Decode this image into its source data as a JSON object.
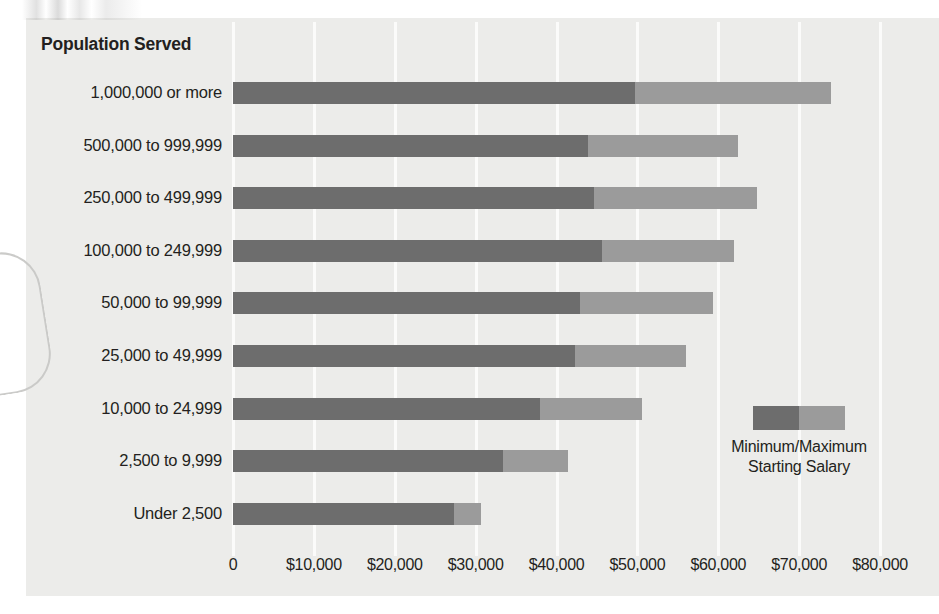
{
  "chart_data": {
    "type": "bar",
    "orientation": "horizontal",
    "stacked": false,
    "title": "Population Served",
    "xlabel": "",
    "ylabel": "Population Served",
    "xlim": [
      0,
      80000
    ],
    "xtick_values": [
      0,
      10000,
      20000,
      30000,
      40000,
      50000,
      60000,
      70000,
      80000
    ],
    "xtick_labels": [
      "0",
      "$10,000",
      "$20,000",
      "$30,000",
      "$40,000",
      "$50,000",
      "$60,000",
      "$70,000",
      "$80,000"
    ],
    "grid": true,
    "grid_axis": "x",
    "legend_position": "inside-right",
    "legend_label": "Minimum/Maximum Starting Salary",
    "legend_label_line1": "Minimum/Maximum",
    "legend_label_line2": "Starting Salary",
    "categories": [
      "1,000,000 or more",
      "500,000 to 999,999",
      "250,000 to 499,999",
      "100,000 to 249,999",
      "50,000 to 99,999",
      "25,000 to 49,999",
      "10,000 to 24,999",
      "2,500 to 9,999",
      "Under 2,500"
    ],
    "series": [
      {
        "name": "Minimum Starting Salary",
        "color": "#6d6d6d",
        "values": [
          49700,
          43900,
          44600,
          45600,
          42900,
          42300,
          38000,
          33400,
          27300
        ]
      },
      {
        "name": "Maximum Starting Salary",
        "color": "#9b9b9b",
        "values": [
          74000,
          62400,
          64800,
          62000,
          59300,
          56000,
          50600,
          41400,
          30700
        ]
      }
    ],
    "rows": [
      {
        "category": "1,000,000 or more",
        "minimum": 49700,
        "maximum": 74000
      },
      {
        "category": "500,000 to 999,999",
        "minimum": 43900,
        "maximum": 62400
      },
      {
        "category": "250,000 to 499,999",
        "minimum": 44600,
        "maximum": 64800
      },
      {
        "category": "100,000 to 249,999",
        "minimum": 45600,
        "maximum": 62000
      },
      {
        "category": "50,000 to 99,999",
        "minimum": 42900,
        "maximum": 59300
      },
      {
        "category": "25,000 to 49,999",
        "minimum": 42300,
        "maximum": 56000
      },
      {
        "category": "10,000 to 24,999",
        "minimum": 38000,
        "maximum": 50600
      },
      {
        "category": "2,500 to 9,999",
        "minimum": 33400,
        "maximum": 41400
      },
      {
        "category": "Under 2,500",
        "minimum": 27300,
        "maximum": 30700
      }
    ]
  },
  "colors": {
    "minimum_bar": "#6d6d6d",
    "maximum_bar": "#9b9b9b",
    "background": "#ececea",
    "gridline": "#fbfbfa",
    "text": "#231f20"
  }
}
